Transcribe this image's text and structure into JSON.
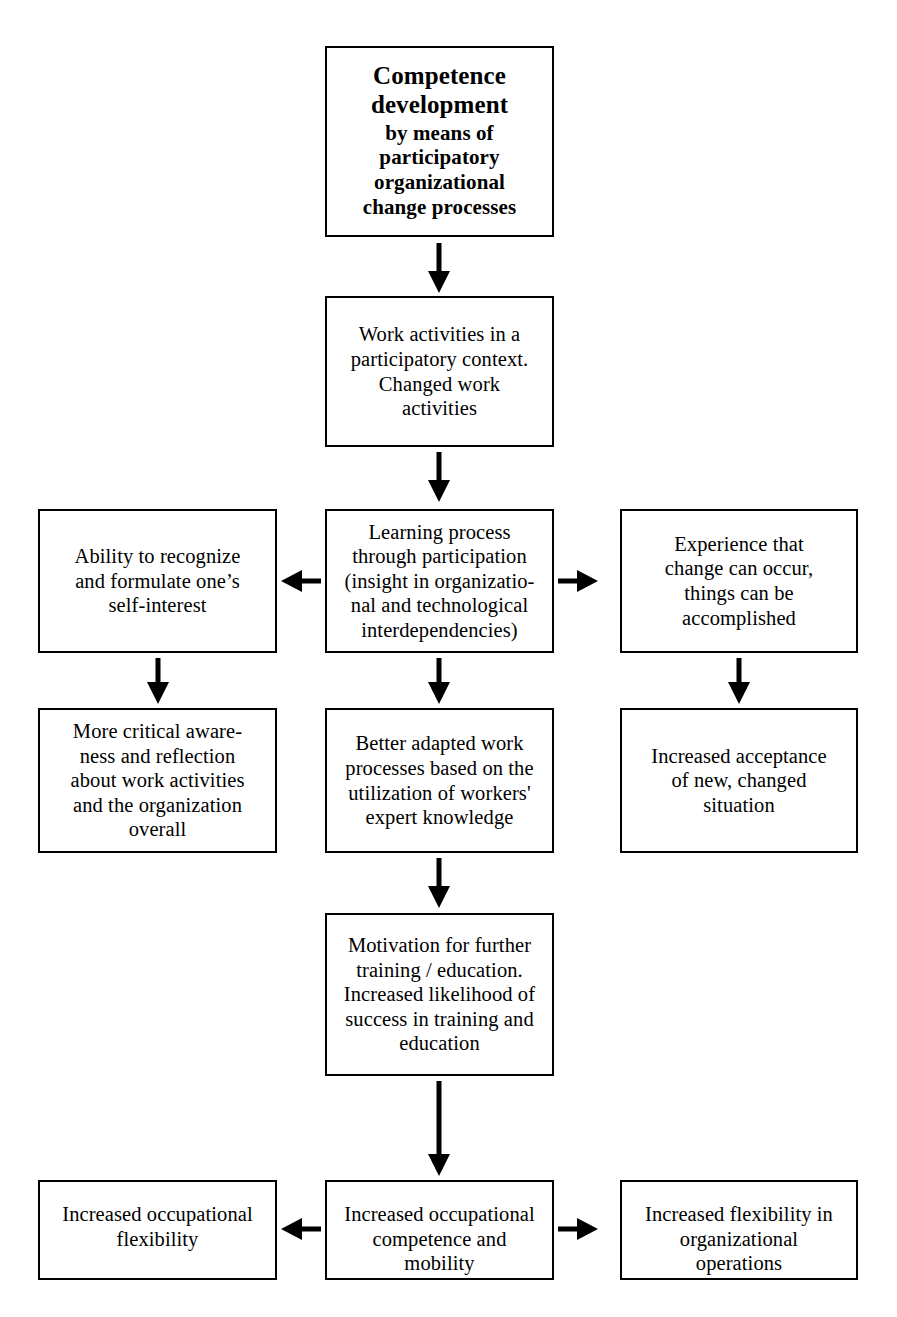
{
  "diagram": {
    "title": "Competence development by means of participatory organizational change processes",
    "type": "flowchart",
    "orientation": "top-to-bottom",
    "background_color": "#ffffff",
    "line_color": "#000000",
    "text_color": "#000000"
  },
  "nodes": {
    "root": {
      "head": "Competence\ndevelopment",
      "sub": "by means of\nparticipatory\norganizational\nchange processes"
    },
    "work_activities": {
      "text": "Work activities in a\nparticipatory context.\nChanged work\nactivities"
    },
    "learning_process": {
      "text": "Learning process\nthrough participation\n(insight in organizatio-\nnal and technological\ninterdependencies)"
    },
    "ability_recognize": {
      "text": "Ability to recognize\nand formulate one’s\nself-interest"
    },
    "experience_change": {
      "text": "Experience that\nchange can occur,\nthings can be\naccomplished"
    },
    "critical_awareness": {
      "text": "More critical aware-\nness and reflection\nabout work activities\nand the organization\noverall"
    },
    "better_adapted": {
      "text": "Better adapted work\nprocesses based on the\nutilization of workers'\nexpert knowledge"
    },
    "increased_acceptance": {
      "text": "Increased acceptance\nof new, changed\nsituation"
    },
    "motivation_training": {
      "text": "Motivation for further\ntraining / education.\nIncreased likelihood of\nsuccess in training and\neducation"
    },
    "occupational_flexibility": {
      "text": "Increased occupational\nflexibility"
    },
    "occupational_competence": {
      "text": "Increased occupational\ncompetence and\nmobility"
    },
    "organizational_flexibility": {
      "text": "Increased flexibility in\norganizational\noperations"
    }
  },
  "edges": [
    {
      "from": "root",
      "to": "work_activities",
      "direction": "down"
    },
    {
      "from": "work_activities",
      "to": "learning_process",
      "direction": "down"
    },
    {
      "from": "learning_process",
      "to": "ability_recognize",
      "direction": "left"
    },
    {
      "from": "learning_process",
      "to": "experience_change",
      "direction": "right"
    },
    {
      "from": "ability_recognize",
      "to": "critical_awareness",
      "direction": "down"
    },
    {
      "from": "learning_process",
      "to": "better_adapted",
      "direction": "down"
    },
    {
      "from": "experience_change",
      "to": "increased_acceptance",
      "direction": "down"
    },
    {
      "from": "better_adapted",
      "to": "motivation_training",
      "direction": "down"
    },
    {
      "from": "motivation_training",
      "to": "occupational_competence",
      "direction": "down"
    },
    {
      "from": "occupational_competence",
      "to": "occupational_flexibility",
      "direction": "left"
    },
    {
      "from": "occupational_competence",
      "to": "organizational_flexibility",
      "direction": "right"
    }
  ]
}
